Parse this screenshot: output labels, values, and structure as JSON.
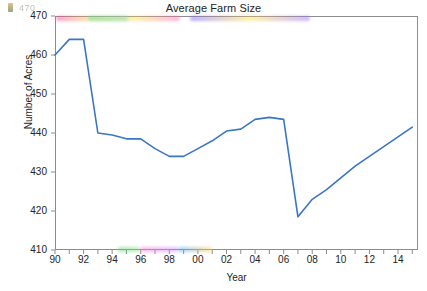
{
  "chart_data": {
    "type": "line",
    "title": "Average Farm Size",
    "xlabel": "Year",
    "ylabel": "Number of Acres",
    "x": [
      1990,
      1991,
      1992,
      1993,
      1994,
      1995,
      1996,
      1997,
      1998,
      1999,
      2000,
      2001,
      2002,
      2003,
      2004,
      2005,
      2006,
      2007,
      2008,
      2009,
      2010,
      2011,
      2012,
      2013,
      2014,
      2015
    ],
    "x_tick_labels": [
      "90",
      "91",
      "92",
      "93",
      "94",
      "95",
      "96",
      "97",
      "98",
      "99",
      "00",
      "01",
      "02",
      "03",
      "04",
      "05",
      "06",
      "07",
      "08",
      "09",
      "10",
      "11",
      "12",
      "13",
      "14",
      "15"
    ],
    "x_major_tick_labels": [
      "90",
      "92",
      "94",
      "96",
      "98",
      "00",
      "02",
      "04",
      "06",
      "08",
      "10",
      "12",
      "14"
    ],
    "values": [
      460,
      464,
      464,
      440,
      439.5,
      438.5,
      438.5,
      436,
      434,
      434,
      436,
      438,
      440.5,
      441,
      443.5,
      444,
      443.5,
      418.5,
      423,
      425.5,
      428.5,
      431.5,
      434,
      436.5,
      439,
      441.5
    ],
    "ylim": [
      410,
      470
    ],
    "y_ticks": [
      410,
      420,
      430,
      440,
      450,
      460,
      470
    ],
    "y_tick_labels": [
      "410",
      "420",
      "430",
      "440",
      "450",
      "460",
      "470"
    ],
    "xlim": [
      1990,
      2015.4
    ],
    "grid": false,
    "legend": "none",
    "series_color": "#3a76c4",
    "axis_color": "#8d8d8d"
  },
  "artifact": {
    "clipped_top_label": "470"
  }
}
